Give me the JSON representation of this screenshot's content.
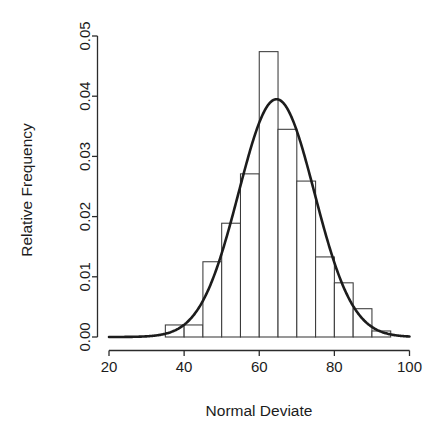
{
  "chart_data": {
    "type": "bar",
    "title": "",
    "subtitle": "",
    "xlabel": "Normal Deviate",
    "ylabel": "Relative Frequency",
    "xlim": [
      20,
      100
    ],
    "ylim": [
      0.0,
      0.05
    ],
    "grid": false,
    "legend": null,
    "x_ticks": [
      20,
      40,
      60,
      80,
      100
    ],
    "x_tick_labels": [
      "20",
      "40",
      "60",
      "80",
      "100"
    ],
    "y_ticks": [
      0.0,
      0.01,
      0.02,
      0.03,
      0.04,
      0.05
    ],
    "y_tick_labels": [
      "0.00",
      "0.01",
      "0.02",
      "0.03",
      "0.04",
      "0.05"
    ],
    "bin_width": 5,
    "bin_edges": [
      35,
      40,
      45,
      50,
      55,
      60,
      65,
      70,
      75,
      80,
      85,
      90,
      95
    ],
    "categories": [
      "35-40",
      "40-45",
      "45-50",
      "50-55",
      "55-60",
      "60-65",
      "65-70",
      "70-75",
      "75-80",
      "80-85",
      "85-90",
      "90-95"
    ],
    "values": [
      0.002,
      0.002,
      0.0125,
      0.0189,
      0.0271,
      0.0474,
      0.0345,
      0.0259,
      0.0133,
      0.009,
      0.0047,
      0.001
    ],
    "series": [
      {
        "name": "Relative Frequency",
        "type": "bar",
        "values": [
          0.002,
          0.002,
          0.0125,
          0.0189,
          0.0271,
          0.0474,
          0.0345,
          0.0259,
          0.0133,
          0.009,
          0.0047,
          0.001
        ]
      },
      {
        "name": "Normal density curve",
        "type": "line",
        "mean": 64.6,
        "sd": 10.1,
        "peak_value": 0.0395
      }
    ],
    "colors": {
      "bar_fill": "#ffffff",
      "bar_stroke": "#3a3a3a",
      "curve": "#1c1c1c",
      "axis": "#2b2b2b",
      "text": "#1c1c1c",
      "background": "#ffffff"
    }
  }
}
